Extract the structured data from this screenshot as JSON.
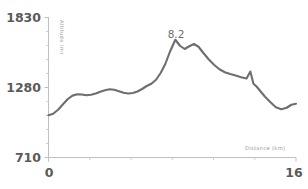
{
  "chart_data": {
    "type": "line",
    "title": "",
    "xlabel": "Distance (km)",
    "ylabel": "Altitude (m)",
    "xlim": [
      0,
      16
    ],
    "ylim": [
      710,
      1830
    ],
    "xticks": [
      0,
      16
    ],
    "xticklabels": [
      "0",
      "16"
    ],
    "yticks": [
      710,
      1280,
      1830
    ],
    "yticklabels": [
      "710",
      "1280",
      "1830"
    ],
    "grid": false,
    "legend": null,
    "line_color": "#6e6e6e",
    "axis_color": "#bfbfbf",
    "annotations": [
      {
        "text": "8.2",
        "x": 8.2,
        "y": 1660,
        "label_x": 8.2,
        "label_y": 1760
      }
    ],
    "x": [
      0.0,
      0.3,
      0.62,
      0.95,
      1.25,
      1.55,
      1.85,
      2.15,
      2.45,
      2.75,
      3.05,
      3.35,
      3.65,
      3.95,
      4.25,
      4.55,
      4.85,
      5.15,
      5.45,
      5.75,
      6.05,
      6.35,
      6.65,
      6.95,
      7.25,
      7.55,
      7.85,
      8.2,
      8.5,
      8.8,
      9.1,
      9.4,
      9.7,
      10.0,
      10.35,
      10.7,
      11.05,
      11.4,
      11.75,
      12.1,
      12.45,
      12.8,
      13.05,
      13.25,
      13.45,
      13.7,
      14.0,
      14.35,
      14.7,
      15.05,
      15.4,
      15.7,
      16.0
    ],
    "y": [
      1048,
      1060,
      1092,
      1138,
      1178,
      1205,
      1216,
      1214,
      1208,
      1212,
      1222,
      1236,
      1248,
      1256,
      1252,
      1240,
      1228,
      1222,
      1226,
      1238,
      1258,
      1282,
      1300,
      1332,
      1386,
      1458,
      1556,
      1652,
      1604,
      1578,
      1600,
      1618,
      1596,
      1548,
      1496,
      1452,
      1416,
      1392,
      1378,
      1366,
      1352,
      1342,
      1398,
      1300,
      1278,
      1240,
      1196,
      1152,
      1112,
      1096,
      1108,
      1132,
      1140
    ]
  }
}
